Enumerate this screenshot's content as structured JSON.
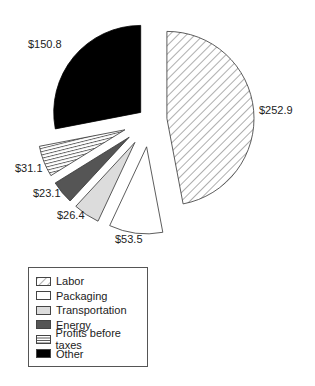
{
  "chart_data": {
    "type": "pie",
    "title": "",
    "categories": [
      "Labor",
      "Packaging",
      "Transportation",
      "Energy",
      "Profits before taxes",
      "Other"
    ],
    "values": [
      252.9,
      53.5,
      26.4,
      23.1,
      31.1,
      150.8
    ],
    "labels": [
      "$252.9",
      "$53.5",
      "$26.4",
      "$23.1",
      "$31.1",
      "$150.8"
    ],
    "fills": [
      "diagonal-hatch",
      "#ffffff",
      "#dcdcdc",
      "#555555",
      "horizontal-hatch",
      "#000000"
    ],
    "exploded": true,
    "legend_position": "bottom-left"
  },
  "legend": {
    "items": [
      {
        "label": "Labor"
      },
      {
        "label": "Packaging"
      },
      {
        "label": "Transportation"
      },
      {
        "label": "Energy"
      },
      {
        "label": "Profits before taxes"
      },
      {
        "label": "Other"
      }
    ]
  }
}
